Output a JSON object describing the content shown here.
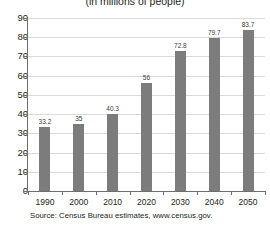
{
  "chart_data": {
    "type": "bar",
    "title": "(in millions of people)",
    "xlabel": "",
    "ylabel": "",
    "categories": [
      "1990",
      "2000",
      "2010",
      "2020",
      "2030",
      "2040",
      "2050"
    ],
    "values": [
      33.2,
      35,
      40.3,
      56,
      72.8,
      79.7,
      83.7
    ],
    "value_labels": [
      "33.2",
      "35",
      "40.3",
      "56",
      "72.8",
      "79.7",
      "83.7"
    ],
    "ylim": [
      0,
      90
    ],
    "ytick_values": [
      0,
      10,
      20,
      30,
      40,
      50,
      60,
      70,
      80,
      90
    ],
    "ytick_labels": [
      "0",
      "10",
      "20",
      "30",
      "40",
      "50",
      "60",
      "70",
      "80",
      "90"
    ],
    "grid": true,
    "legend": false,
    "bar_color": "#7c7c7c",
    "gridline_color": "#d9d9d9",
    "axis_color": "#6d6e71",
    "background": "#ffffff",
    "source": "Source: Census Bureau estimates, www.census.gov."
  }
}
